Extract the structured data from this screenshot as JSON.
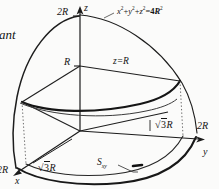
{
  "figure": {
    "domain": "math-diagram",
    "description_text": "rant",
    "background_color": "#fbfbfa",
    "ink_color": "#141414",
    "axes": {
      "z": {
        "label": "z",
        "tip_label": "2R"
      },
      "y": {
        "label": "y",
        "tip_label": "2R"
      },
      "x": {
        "label": "x",
        "tip_label": "2R"
      }
    },
    "labels": {
      "sphere_equation": "x²+y²+z²=4R²",
      "sphere_eq_parts": {
        "x": "x",
        "xe": "2",
        "plus1": "+",
        "y": "y",
        "ye": "2",
        "plus2": "+",
        "z": "z",
        "ze": "2",
        "eq": "=",
        "four": "4",
        "R": "R",
        "Re": "2"
      },
      "mid_radius": "R",
      "plane": "z=R",
      "chord_right": "√3R",
      "chord_left": "√3R",
      "region": "Sxy",
      "region_base": "S",
      "region_sub": "xy",
      "sqrt_symbol": "√",
      "sqrt_value": "3",
      "sqrt_unit": "R"
    },
    "geometry": {
      "sphere_radius_label": "2R",
      "cut_plane_height_label": "R",
      "cut_circle_radius_label": "√3R",
      "base_region_label": "Sxy"
    }
  }
}
